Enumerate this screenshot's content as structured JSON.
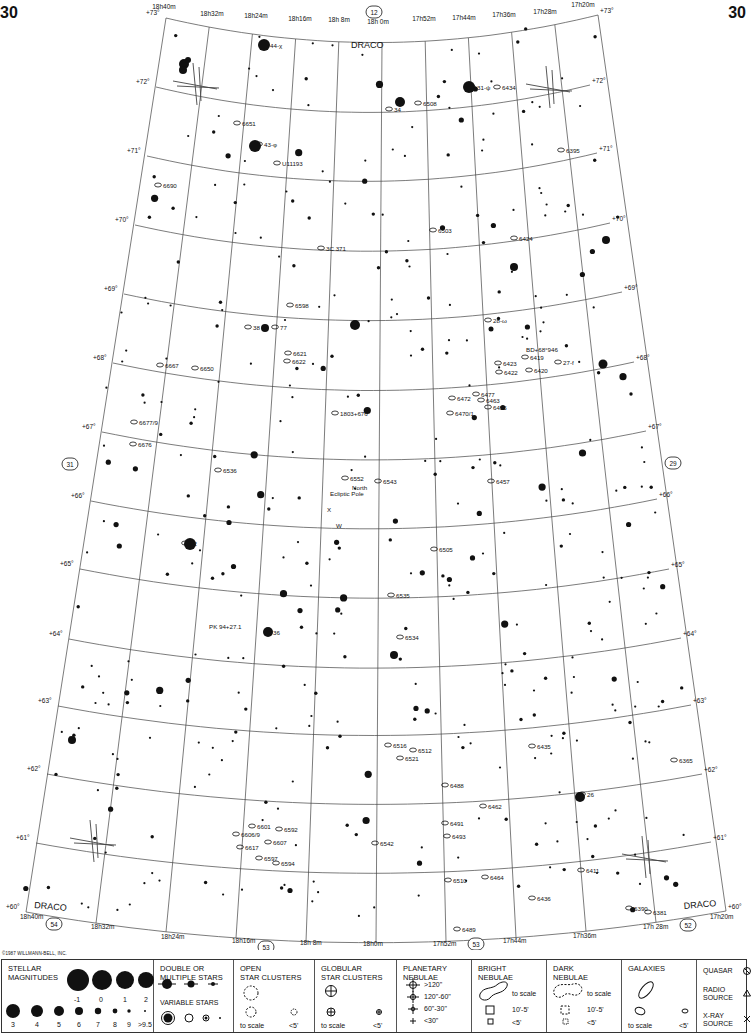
{
  "page": {
    "number_left": "30",
    "number_right": "30",
    "copyright": "©1987 WILLMANN-BELL, INC."
  },
  "chart": {
    "constellation_labels": [
      {
        "text": "DRACO",
        "x": 351,
        "y": 48,
        "rot": 0
      },
      {
        "text": "DRACO",
        "x": 34,
        "y": 908,
        "rot": 5
      },
      {
        "text": "DRACO",
        "x": 684,
        "y": 909,
        "rot": -5
      }
    ],
    "adjacent_charts": [
      {
        "num": "12",
        "x": 374,
        "y": 13
      },
      {
        "num": "31",
        "x": 70,
        "y": 465
      },
      {
        "num": "29",
        "x": 673,
        "y": 464
      },
      {
        "num": "54",
        "x": 54,
        "y": 925
      },
      {
        "num": "53",
        "x": 266,
        "y": 948
      },
      {
        "num": "53",
        "x": 476,
        "y": 945
      },
      {
        "num": "52",
        "x": 688,
        "y": 926
      }
    ],
    "ra_top": [
      {
        "text": "18h40m",
        "x": 164,
        "y": 9
      },
      {
        "text": "18h32m",
        "x": 212,
        "y": 16
      },
      {
        "text": "18h24m",
        "x": 256,
        "y": 18
      },
      {
        "text": "18h16m",
        "x": 300,
        "y": 21
      },
      {
        "text": "18h 8m",
        "x": 339,
        "y": 22
      },
      {
        "text": "18h 0m",
        "x": 378,
        "y": 24
      },
      {
        "text": "17h52m",
        "x": 424,
        "y": 21
      },
      {
        "text": "17h44m",
        "x": 464,
        "y": 20
      },
      {
        "text": "17h36m",
        "x": 504,
        "y": 17
      },
      {
        "text": "17h28m",
        "x": 545,
        "y": 14
      },
      {
        "text": "17h20m",
        "x": 583,
        "y": 7
      }
    ],
    "ra_bottom": [
      {
        "text": "18h40m",
        "x": 20,
        "y": 919
      },
      {
        "text": "18h32m",
        "x": 91,
        "y": 929
      },
      {
        "text": "18h24m",
        "x": 161,
        "y": 939
      },
      {
        "text": "18h16m",
        "x": 232,
        "y": 943
      },
      {
        "text": "18h 8m",
        "x": 300,
        "y": 945
      },
      {
        "text": "18h0m",
        "x": 363,
        "y": 946
      },
      {
        "text": "17h52m",
        "x": 433,
        "y": 946
      },
      {
        "text": "17h44m",
        "x": 503,
        "y": 943
      },
      {
        "text": "17h36m",
        "x": 573,
        "y": 938
      },
      {
        "text": "17h 28m",
        "x": 643,
        "y": 929
      },
      {
        "text": "17h20m",
        "x": 710,
        "y": 919
      }
    ],
    "dec_left": [
      {
        "text": "+73°",
        "x": 146,
        "y": 15
      },
      {
        "text": "+72°",
        "x": 136,
        "y": 84
      },
      {
        "text": "+71°",
        "x": 127,
        "y": 153
      },
      {
        "text": "+70°",
        "x": 115,
        "y": 222
      },
      {
        "text": "+69°",
        "x": 104,
        "y": 291
      },
      {
        "text": "+68°",
        "x": 93,
        "y": 360
      },
      {
        "text": "+67°",
        "x": 82,
        "y": 429
      },
      {
        "text": "+66°",
        "x": 71,
        "y": 498
      },
      {
        "text": "+65°",
        "x": 60,
        "y": 566
      },
      {
        "text": "+64°",
        "x": 49,
        "y": 636
      },
      {
        "text": "+63°",
        "x": 38,
        "y": 703
      },
      {
        "text": "+62°",
        "x": 27,
        "y": 771
      },
      {
        "text": "+61°",
        "x": 16,
        "y": 840
      },
      {
        "text": "+60°",
        "x": 6,
        "y": 909
      }
    ],
    "dec_right": [
      {
        "text": "+73°",
        "x": 600,
        "y": 13
      },
      {
        "text": "+72°",
        "x": 592,
        "y": 83
      },
      {
        "text": "+71°",
        "x": 599,
        "y": 151
      },
      {
        "text": "+70°",
        "x": 612,
        "y": 221
      },
      {
        "text": "+69°",
        "x": 624,
        "y": 290
      },
      {
        "text": "+68°",
        "x": 636,
        "y": 360
      },
      {
        "text": "+67°",
        "x": 648,
        "y": 429
      },
      {
        "text": "+66°",
        "x": 659,
        "y": 497
      },
      {
        "text": "+65°",
        "x": 671,
        "y": 567
      },
      {
        "text": "+64°",
        "x": 683,
        "y": 636
      },
      {
        "text": "+63°",
        "x": 693,
        "y": 703
      },
      {
        "text": "+62°",
        "x": 704,
        "y": 772
      },
      {
        "text": "+61°",
        "x": 713,
        "y": 840
      },
      {
        "text": "+60°",
        "x": 728,
        "y": 909
      }
    ],
    "object_labels": [
      {
        "text": "44-χ",
        "x": 270,
        "y": 48
      },
      {
        "text": "31-ψ",
        "x": 477,
        "y": 90
      },
      {
        "text": "6434",
        "x": 502,
        "y": 90
      },
      {
        "text": "34",
        "x": 394,
        "y": 112
      },
      {
        "text": "6508",
        "x": 423,
        "y": 106
      },
      {
        "text": "6651",
        "x": 242,
        "y": 126
      },
      {
        "text": "43-φ",
        "x": 264,
        "y": 147
      },
      {
        "text": "6395",
        "x": 566,
        "y": 153
      },
      {
        "text": "U11193",
        "x": 282,
        "y": 166
      },
      {
        "text": "6690",
        "x": 163,
        "y": 188
      },
      {
        "text": "6503",
        "x": 438,
        "y": 233
      },
      {
        "text": "6424",
        "x": 519,
        "y": 241
      },
      {
        "text": "3C 371",
        "x": 326,
        "y": 251
      },
      {
        "text": "6598",
        "x": 295,
        "y": 308
      },
      {
        "text": "28-ω",
        "x": 493,
        "y": 323
      },
      {
        "text": "38",
        "x": 253,
        "y": 330
      },
      {
        "text": "77",
        "x": 280,
        "y": 330
      },
      {
        "text": "BD+68°946",
        "x": 526,
        "y": 352
      },
      {
        "text": "6419",
        "x": 530,
        "y": 360
      },
      {
        "text": "6621",
        "x": 293,
        "y": 356
      },
      {
        "text": "6622",
        "x": 292,
        "y": 364
      },
      {
        "text": "6423",
        "x": 503,
        "y": 366
      },
      {
        "text": "27-f",
        "x": 563,
        "y": 365
      },
      {
        "text": "6422",
        "x": 504,
        "y": 375
      },
      {
        "text": "6420",
        "x": 534,
        "y": 373
      },
      {
        "text": "6667",
        "x": 165,
        "y": 368
      },
      {
        "text": "6650",
        "x": 200,
        "y": 371
      },
      {
        "text": "6477",
        "x": 481,
        "y": 397
      },
      {
        "text": "6472",
        "x": 457,
        "y": 401
      },
      {
        "text": "6463",
        "x": 486,
        "y": 403
      },
      {
        "text": "6455",
        "x": 493,
        "y": 410
      },
      {
        "text": "6470/1",
        "x": 455,
        "y": 416
      },
      {
        "text": "1803+676",
        "x": 340,
        "y": 416
      },
      {
        "text": "6677/9",
        "x": 139,
        "y": 425
      },
      {
        "text": "6676",
        "x": 138,
        "y": 447
      },
      {
        "text": "6536",
        "x": 223,
        "y": 473
      },
      {
        "text": "6552",
        "x": 350,
        "y": 481
      },
      {
        "text": "6543",
        "x": 383,
        "y": 484
      },
      {
        "text": "North",
        "x": 352,
        "y": 490
      },
      {
        "text": "Ecliptic Pole",
        "x": 330,
        "y": 496
      },
      {
        "text": "6457",
        "x": 496,
        "y": 484
      },
      {
        "text": "X",
        "x": 327,
        "y": 512
      },
      {
        "text": "W",
        "x": 336,
        "y": 528
      },
      {
        "text": "42",
        "x": 190,
        "y": 546
      },
      {
        "text": "6505",
        "x": 439,
        "y": 552
      },
      {
        "text": "6535",
        "x": 396,
        "y": 598
      },
      {
        "text": "PK 94+27.1",
        "x": 209,
        "y": 629
      },
      {
        "text": "36",
        "x": 273,
        "y": 635
      },
      {
        "text": "6534",
        "x": 405,
        "y": 640
      },
      {
        "text": "6516",
        "x": 393,
        "y": 748
      },
      {
        "text": "6512",
        "x": 418,
        "y": 753
      },
      {
        "text": "6521",
        "x": 405,
        "y": 761
      },
      {
        "text": "6435",
        "x": 537,
        "y": 749
      },
      {
        "text": "6365",
        "x": 679,
        "y": 763
      },
      {
        "text": "6488",
        "x": 450,
        "y": 788
      },
      {
        "text": "26",
        "x": 587,
        "y": 797
      },
      {
        "text": "6462",
        "x": 488,
        "y": 809
      },
      {
        "text": "6491",
        "x": 450,
        "y": 826
      },
      {
        "text": "6493",
        "x": 452,
        "y": 839
      },
      {
        "text": "6601",
        "x": 257,
        "y": 829
      },
      {
        "text": "6592",
        "x": 284,
        "y": 832
      },
      {
        "text": "6606/9",
        "x": 241,
        "y": 837
      },
      {
        "text": "6607",
        "x": 273,
        "y": 845
      },
      {
        "text": "6617",
        "x": 245,
        "y": 850
      },
      {
        "text": "6542",
        "x": 380,
        "y": 846
      },
      {
        "text": "6597",
        "x": 264,
        "y": 861
      },
      {
        "text": "6594",
        "x": 281,
        "y": 866
      },
      {
        "text": "6510",
        "x": 453,
        "y": 883
      },
      {
        "text": "6411",
        "x": 586,
        "y": 873
      },
      {
        "text": "6464",
        "x": 490,
        "y": 880
      },
      {
        "text": "6436",
        "x": 537,
        "y": 901
      },
      {
        "text": "6390",
        "x": 634,
        "y": 911
      },
      {
        "text": "6381",
        "x": 653,
        "y": 915
      },
      {
        "text": "6489",
        "x": 462,
        "y": 932
      }
    ]
  },
  "legend": {
    "stellar": {
      "title": "STELLAR\nMAGNITUDES",
      "row1": [
        "-1",
        "0",
        "1",
        "2"
      ],
      "row2": [
        "3",
        "4",
        "5",
        "6",
        "7",
        "8",
        "9",
        ">9.5"
      ]
    },
    "double": {
      "title": "DOUBLE OR\nMULTIPLE STARS",
      "variable_title": "VARIABLE STARS"
    },
    "open": {
      "title": "OPEN\nSTAR CLUSTERS",
      "to_scale": "to scale",
      "small": "<5'"
    },
    "globular": {
      "title": "GLOBULAR\nSTAR CLUSTERS",
      "to_scale": "to scale",
      "small": "<5'"
    },
    "planetary": {
      "title": "PLANETARY\nNEBULAE",
      "sizes": [
        ">120\"",
        "120\"-60\"",
        "60\"-30\"",
        "<30\""
      ]
    },
    "bright": {
      "title": "BRIGHT\nNEBULAE",
      "to_scale": "to scale",
      "mid": "10'-5'",
      "small": "<5'"
    },
    "dark": {
      "title": "DARK\nNEBULAE",
      "to_scale": "to scale",
      "mid": "10'-5'",
      "small": "<5'"
    },
    "galaxies": {
      "title": "GALAXIES",
      "to_scale": "to scale",
      "small": "<5'"
    },
    "other": {
      "quasar": "QUASAR",
      "radio": "RADIO\nSOURCE",
      "xray": "X-RAY\nSOURCE"
    }
  }
}
